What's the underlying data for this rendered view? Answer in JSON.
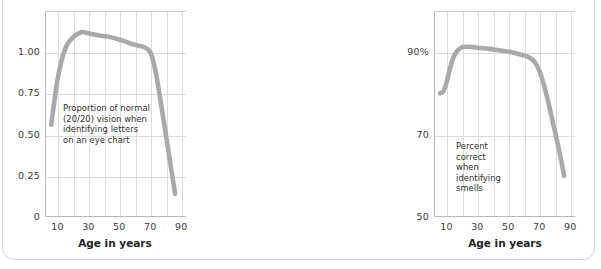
{
  "figure": {
    "panel_count": 3,
    "frame_color": "#cfcfcf",
    "curve_color": "#a9a9a9",
    "grid_color": "#dcdcdc",
    "axis_color": "#b9b9b9",
    "background": "#ffffff"
  },
  "panels": [
    {
      "id": "vision",
      "annotation": "Proportion of normal\n(20/20) vision when\nidentifying letters\non an eye chart",
      "xlabel": "Age in years",
      "yticks": [
        "0",
        "0.25",
        "0.50",
        "0.75",
        "1.00"
      ],
      "ytick_values": [
        0,
        0.25,
        0.5,
        0.75,
        1.0
      ],
      "xticks": [
        "10",
        "30",
        "50",
        "70",
        "90"
      ],
      "xtick_values": [
        10,
        30,
        50,
        70,
        90
      ]
    },
    {
      "id": "smell",
      "annotation": "Percent correct when\nidentifying smells",
      "xlabel": "Age in years",
      "yticks": [
        "50",
        "70",
        "90%"
      ],
      "ytick_values": [
        50,
        70,
        90
      ],
      "xticks": [
        "10",
        "30",
        "50",
        "70",
        "90"
      ],
      "xtick_values": [
        10,
        30,
        50,
        70,
        90
      ]
    },
    {
      "id": "speech",
      "annotation": "Percent correct when\nidentifying spoken words",
      "xlabel": "Age in years",
      "yticks": [
        "50",
        "70",
        "90%"
      ],
      "ytick_values": [
        50,
        70,
        90
      ],
      "xticks": [
        "10",
        "30",
        "50",
        "70",
        "90"
      ],
      "xtick_values": [
        10,
        30,
        50,
        70,
        90
      ]
    }
  ],
  "chart_data": [
    {
      "type": "line",
      "id": "vision",
      "title": "",
      "xlabel": "Age in years",
      "ylabel": "",
      "annotation": "Proportion of normal (20/20) vision when identifying letters on an eye chart",
      "xlim": [
        5,
        90
      ],
      "ylim": [
        0,
        1.25
      ],
      "xticks": [
        10,
        30,
        50,
        70,
        90
      ],
      "yticks": [
        0,
        0.25,
        0.5,
        0.75,
        1.0
      ],
      "ytick_labels": [
        "0",
        "0.25",
        "0.50",
        "0.75",
        "1.00"
      ],
      "grid": true,
      "legend": "none",
      "x": [
        6,
        8,
        10,
        13,
        16,
        20,
        25,
        28,
        32,
        38,
        45,
        52,
        58,
        62,
        66,
        70,
        73,
        76,
        79,
        82,
        85,
        86
      ],
      "y": [
        0.56,
        0.7,
        0.83,
        0.96,
        1.04,
        1.09,
        1.12,
        1.12,
        1.11,
        1.1,
        1.09,
        1.07,
        1.05,
        1.04,
        1.03,
        1.0,
        0.9,
        0.74,
        0.56,
        0.38,
        0.2,
        0.14
      ]
    },
    {
      "type": "line",
      "id": "smell",
      "title": "",
      "xlabel": "Age in years",
      "ylabel": "",
      "annotation": "Percent correct when identifying smells",
      "xlim": [
        5,
        90
      ],
      "ylim": [
        50,
        100
      ],
      "xticks": [
        10,
        30,
        50,
        70,
        90
      ],
      "yticks": [
        50,
        70,
        90
      ],
      "ytick_labels": [
        "50",
        "70",
        "90%"
      ],
      "grid": true,
      "legend": "none",
      "x": [
        6,
        8,
        10,
        13,
        16,
        20,
        25,
        30,
        38,
        45,
        52,
        58,
        63,
        67,
        70,
        73,
        76,
        79,
        82,
        85,
        86
      ],
      "y": [
        80.0,
        80.5,
        82.5,
        87.0,
        89.8,
        91.2,
        91.3,
        91.1,
        90.8,
        90.4,
        90.0,
        89.4,
        88.8,
        87.6,
        85.5,
        82.0,
        77.5,
        72.5,
        67.5,
        62.0,
        60.0
      ]
    },
    {
      "type": "line",
      "id": "speech",
      "title": "",
      "xlabel": "Age in years",
      "ylabel": "",
      "annotation": "Percent correct when identifying spoken words",
      "xlim": [
        5,
        85
      ],
      "ylim": [
        50,
        100
      ],
      "xticks": [
        10,
        30,
        50,
        70,
        90
      ],
      "yticks": [
        50,
        70,
        90
      ],
      "ytick_labels": [
        "50",
        "70",
        "90%"
      ],
      "grid": true,
      "legend": "none",
      "x": [
        6,
        10,
        14,
        18,
        22,
        26,
        30,
        35,
        42,
        50,
        56,
        62,
        67,
        71,
        75,
        78,
        80,
        82
      ],
      "y": [
        90.0,
        91.4,
        92.6,
        93.6,
        94.2,
        94.4,
        93.9,
        92.8,
        91.4,
        89.4,
        87.4,
        84.8,
        81.8,
        78.4,
        73.8,
        69.2,
        65.5,
        62.5
      ]
    }
  ]
}
